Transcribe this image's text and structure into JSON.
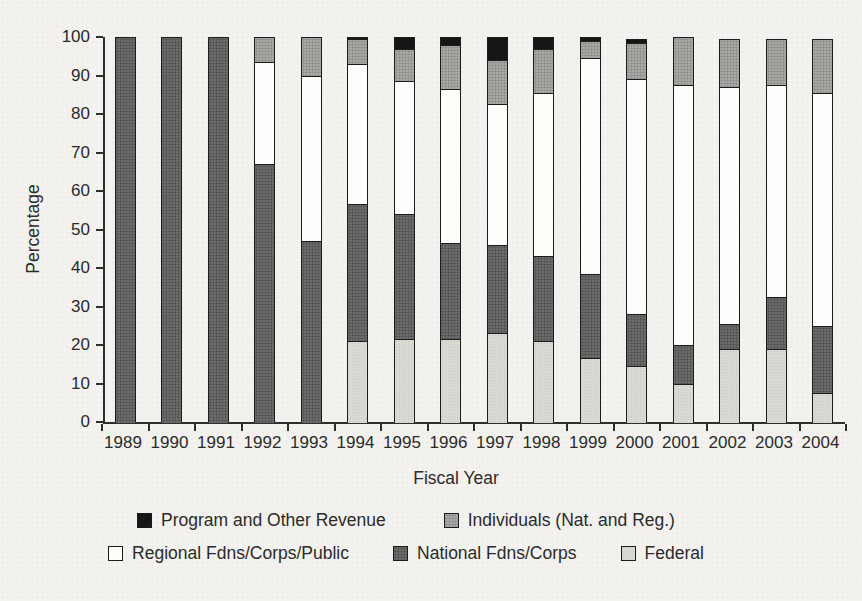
{
  "chart_data": {
    "type": "bar",
    "stacked": true,
    "title": "",
    "xlabel": "Fiscal Year",
    "ylabel": "Percentage",
    "ylim": [
      0,
      100
    ],
    "yticks": [
      0,
      10,
      20,
      30,
      40,
      50,
      60,
      70,
      80,
      90,
      100
    ],
    "grid": false,
    "legend_position": "bottom",
    "categories": [
      "1989",
      "1990",
      "1991",
      "1992",
      "1993",
      "1994",
      "1995",
      "1996",
      "1997",
      "1998",
      "1999",
      "2000",
      "2001",
      "2002",
      "2003",
      "2004"
    ],
    "series": [
      {
        "name": "Federal",
        "color": "#d9d8d3",
        "values": [
          0,
          0,
          0,
          0,
          0,
          21,
          21.5,
          21.5,
          23,
          21,
          16.5,
          14.5,
          10,
          19,
          19,
          7.5
        ]
      },
      {
        "name": "National Fdns/Corps",
        "color": "#6c6c6c",
        "values": [
          100,
          100,
          100,
          67,
          47,
          35.5,
          32.5,
          25,
          23,
          22,
          22,
          13.5,
          10,
          6.5,
          13.5,
          17.5
        ]
      },
      {
        "name": "Regional Fdns/Corps/Public",
        "color": "#fdfdfb",
        "values": [
          0,
          0,
          0,
          26.5,
          43,
          36.5,
          34.5,
          40,
          36.5,
          42.5,
          56,
          61,
          67.5,
          61.5,
          55,
          60.5
        ]
      },
      {
        "name": "Individuals (Nat. and Reg.)",
        "color": "#a9a8a4",
        "values": [
          0,
          0,
          0,
          6.5,
          10,
          6.5,
          8.5,
          11.5,
          11.5,
          11.5,
          4.5,
          9.5,
          12.5,
          12.5,
          12,
          14
        ]
      },
      {
        "name": "Program and Other Revenue",
        "color": "#161616",
        "values": [
          0,
          0,
          0,
          0,
          0,
          0.5,
          3,
          2,
          6,
          3,
          1,
          1,
          0,
          0,
          0,
          0
        ]
      }
    ],
    "legend_rows": [
      [
        "Program and Other Revenue",
        "Individuals (Nat. and Reg.)"
      ],
      [
        "Regional Fdns/Corps/Public",
        "National Fdns/Corps",
        "Federal"
      ]
    ]
  }
}
